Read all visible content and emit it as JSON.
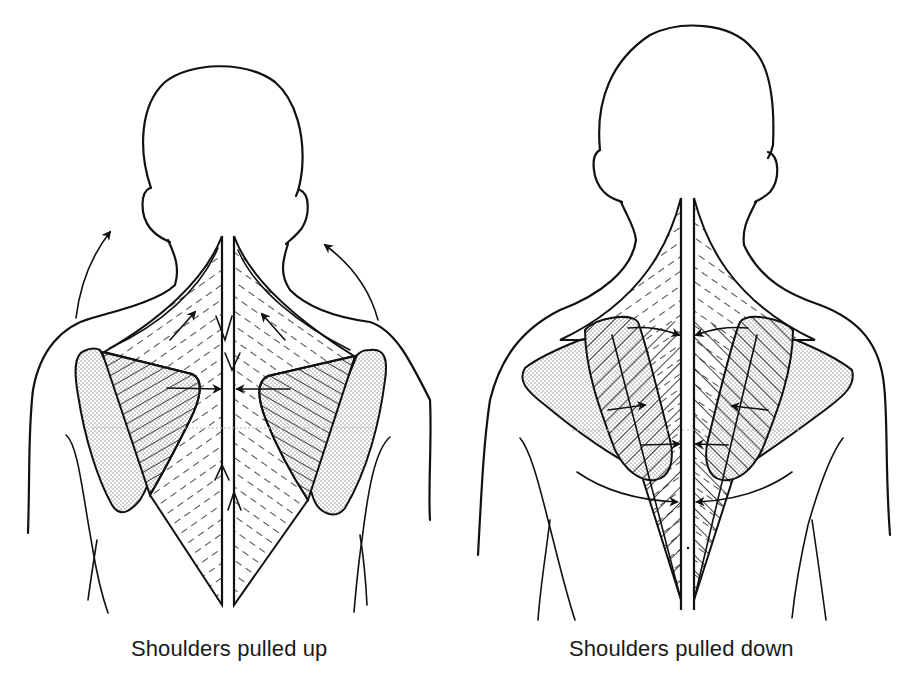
{
  "figures": [
    {
      "id": "left",
      "caption": "Shoulders pulled up",
      "shoulder_motion": "upward",
      "arrow_icons": [
        "curved-arrow-up-left",
        "curved-arrow-up-right",
        "arrows-converging-spine",
        "arrows-up-along-spine",
        "arrows-down-along-spine"
      ]
    },
    {
      "id": "right",
      "caption": "Shoulders pulled down",
      "shoulder_motion": "downward",
      "arrow_icons": [
        "arrows-converging-spine-upper",
        "arrows-converging-spine-middle",
        "arrows-converging-spine-lower",
        "curved-arrows-inward-lower"
      ]
    }
  ],
  "colors": {
    "line": "#111111",
    "background": "#ffffff",
    "stipple": "#8c8c8c"
  }
}
